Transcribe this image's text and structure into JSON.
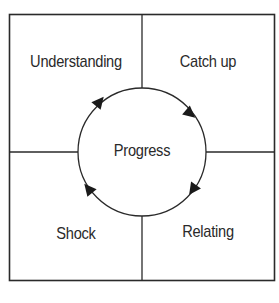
{
  "diagram": {
    "quadrants": [
      {
        "id": "top-left",
        "label": "Understanding"
      },
      {
        "id": "top-right",
        "label": "Catch up"
      },
      {
        "id": "bottom-right",
        "label": "Relating"
      },
      {
        "id": "bottom-left",
        "label": "Shock"
      }
    ],
    "center_label": "Progress",
    "cycle_direction": "clockwise",
    "caption": "Five phases of culture shock (caption cut off)",
    "colors": {
      "stroke": "#2a2a2a",
      "background": "#ffffff"
    }
  }
}
